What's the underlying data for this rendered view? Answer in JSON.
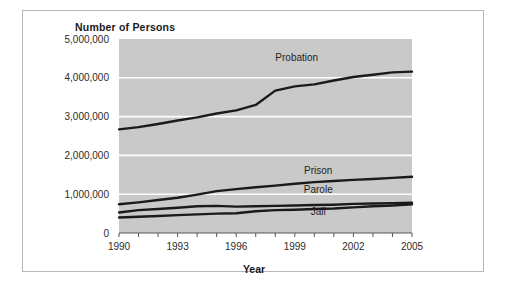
{
  "figure": {
    "title": "Number of Persons",
    "xaxis_title": "Year",
    "border_color": "#b8b8b8",
    "plot_background": "#c9c9c9",
    "gridline_color": "#ffffff",
    "line_color": "#1a1a1a"
  },
  "chart_data": {
    "type": "line",
    "title": "Number of Persons",
    "xlabel": "Year",
    "ylabel": "Number of Persons",
    "xlim": [
      1990,
      2005
    ],
    "ylim": [
      0,
      5000000
    ],
    "grid": true,
    "legend_position": "inline-labels",
    "ytick_labels": [
      "0",
      "1,000,000",
      "2,000,000",
      "3,000,000",
      "4,000,000",
      "5,000,000"
    ],
    "ytick_values": [
      0,
      1000000,
      2000000,
      3000000,
      4000000,
      5000000
    ],
    "xtick_labels": [
      "1990",
      "1993",
      "1996",
      "1999",
      "2002",
      "2005"
    ],
    "xtick_values": [
      1990,
      1993,
      1996,
      1999,
      2002,
      2005
    ],
    "x": [
      1990,
      1991,
      1992,
      1993,
      1994,
      1995,
      1996,
      1997,
      1998,
      1999,
      2000,
      2001,
      2002,
      2003,
      2004,
      2005
    ],
    "series": [
      {
        "name": "Probation",
        "label": "Probation",
        "label_x": 1999.1,
        "label_y": 4430000,
        "values": [
          2670000,
          2730000,
          2810000,
          2900000,
          2980000,
          3080000,
          3160000,
          3300000,
          3670000,
          3780000,
          3830000,
          3930000,
          4020000,
          4080000,
          4140000,
          4160000
        ]
      },
      {
        "name": "Prison",
        "label": "Prison",
        "label_x": 2000.2,
        "label_y": 1530000,
        "values": [
          740000,
          790000,
          850000,
          910000,
          990000,
          1080000,
          1130000,
          1180000,
          1220000,
          1270000,
          1310000,
          1340000,
          1370000,
          1390000,
          1420000,
          1450000
        ]
      },
      {
        "name": "Parole",
        "label": "Parole",
        "label_x": 2000.2,
        "label_y": 1040000,
        "values": [
          530000,
          590000,
          620000,
          650000,
          690000,
          700000,
          680000,
          690000,
          700000,
          710000,
          720000,
          730000,
          750000,
          760000,
          770000,
          780000
        ]
      },
      {
        "name": "Jail",
        "label": "Jail",
        "label_x": 2000.2,
        "label_y": 460000,
        "values": [
          400000,
          420000,
          440000,
          460000,
          480000,
          500000,
          510000,
          560000,
          590000,
          600000,
          620000,
          630000,
          660000,
          690000,
          710000,
          740000
        ]
      }
    ]
  }
}
